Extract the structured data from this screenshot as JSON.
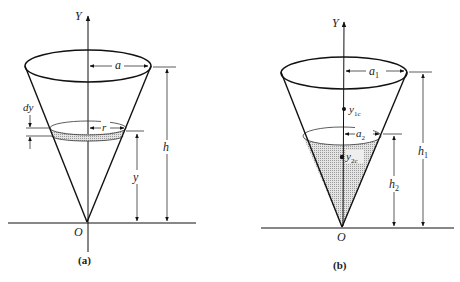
{
  "figure_a": {
    "caption": "(a)",
    "axis_label": "Y",
    "origin_label": "O",
    "radius_top_label": "a",
    "radius_slice_label": "r",
    "slice_thickness_label": "dy",
    "slice_height_label": "y",
    "total_height_label": "h"
  },
  "figure_b": {
    "caption": "(b)",
    "axis_label": "Y",
    "origin_label": "O",
    "radius_top_label": "a",
    "radius_top_sub": "1",
    "radius_liquid_label": "a",
    "radius_liquid_sub": "2",
    "centroid_full_label": "y",
    "centroid_full_sub": "1c",
    "centroid_liquid_label": "y",
    "centroid_liquid_sub": "2c",
    "liquid_height_label": "h",
    "liquid_height_sub": "2",
    "total_height_label": "h",
    "total_height_sub": "1"
  },
  "colors": {
    "line": "#111111",
    "shade": "#c8c8c8",
    "background": "#ffffff"
  }
}
